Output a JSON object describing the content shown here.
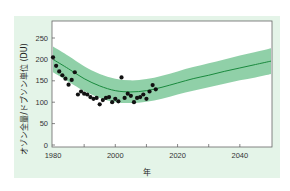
{
  "chart_data": {
    "type": "scatter",
    "title": "",
    "xlabel": "年",
    "ylabel": "オゾン全量/ドブソン単位 (DU)",
    "xlim": [
      1980,
      2050
    ],
    "ylim": [
      0,
      280
    ],
    "xticks": [
      1980,
      2000,
      2020,
      2040
    ],
    "yticks": [
      0,
      50,
      100,
      150,
      200,
      250
    ],
    "grid": false,
    "legend": "none",
    "colors": {
      "background": "#e4f4e8",
      "plot_area": "#ffffff",
      "band": "#7cc899",
      "line": "#1a8a3e",
      "points": "#111111",
      "axis": "#555555"
    },
    "series": [
      {
        "name": "observed",
        "type": "scatter",
        "x": [
          1980,
          1981,
          1982,
          1983,
          1984,
          1985,
          1986,
          1987,
          1988,
          1989,
          1990,
          1991,
          1992,
          1993,
          1994,
          1995,
          1996,
          1997,
          1998,
          1999,
          2000,
          2001,
          2002,
          2003,
          2004,
          2005,
          2006,
          2007,
          2008,
          2009,
          2010,
          2011,
          2012,
          2013
        ],
        "y": [
          205,
          185,
          172,
          163,
          155,
          141,
          152,
          170,
          118,
          125,
          120,
          118,
          112,
          108,
          110,
          95,
          105,
          110,
          112,
          100,
          108,
          102,
          158,
          110,
          120,
          115,
          100,
          110,
          112,
          118,
          108,
          125,
          140,
          130
        ]
      },
      {
        "name": "model mean",
        "type": "line",
        "x": [
          1980,
          1985,
          1990,
          1995,
          2000,
          2005,
          2010,
          2015,
          2020,
          2025,
          2030,
          2035,
          2040,
          2045,
          2050
        ],
        "y": [
          200,
          178,
          155,
          138,
          127,
          124,
          127,
          135,
          145,
          155,
          163,
          172,
          180,
          188,
          196
        ]
      },
      {
        "name": "uncertainty band",
        "type": "area",
        "x": [
          1980,
          1985,
          1990,
          1995,
          2000,
          2005,
          2010,
          2015,
          2020,
          2025,
          2030,
          2035,
          2040,
          2045,
          2050
        ],
        "y_low": [
          170,
          148,
          126,
          110,
          100,
          98,
          101,
          108,
          118,
          127,
          135,
          143,
          151,
          158,
          166
        ],
        "y_high": [
          230,
          208,
          184,
          166,
          155,
          151,
          154,
          162,
          172,
          182,
          191,
          200,
          209,
          217,
          226
        ]
      }
    ]
  }
}
